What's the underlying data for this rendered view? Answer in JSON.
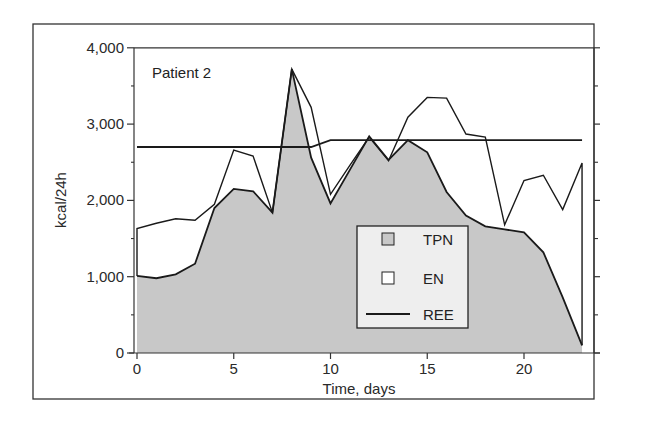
{
  "chart_data": {
    "type": "area",
    "title": "",
    "panel_label": "Patient 2",
    "xlabel": "Time, days",
    "ylabel": "kcal/24h",
    "xlim": [
      0,
      23
    ],
    "ylim": [
      0,
      4000
    ],
    "x_ticks": [
      0,
      5,
      10,
      15,
      20
    ],
    "x_tick_labels": [
      "0",
      "5",
      "10",
      "15",
      "20"
    ],
    "y_ticks": [
      0,
      1000,
      2000,
      3000,
      4000
    ],
    "y_tick_labels": [
      "0",
      "1,000",
      "2,000",
      "3,000",
      "4,000"
    ],
    "grid": false,
    "legend_position": "lower-right-inside",
    "x": [
      0,
      1,
      2,
      3,
      4,
      5,
      6,
      7,
      8,
      9,
      10,
      11,
      12,
      13,
      14,
      15,
      16,
      17,
      18,
      19,
      20,
      21,
      22,
      23
    ],
    "series": [
      {
        "name": "TPN",
        "style": "filled-area",
        "color": "#c8c8c8",
        "values": [
          1010,
          980,
          1030,
          1170,
          1900,
          2150,
          2120,
          1840,
          3720,
          2560,
          1960,
          2400,
          2840,
          2530,
          2790,
          2630,
          2110,
          1800,
          1660,
          1620,
          1580,
          1320,
          730,
          100
        ]
      },
      {
        "name": "EN",
        "style": "open-area-top-line",
        "color": "#ffffff",
        "values": [
          1630,
          1700,
          1760,
          1740,
          1950,
          2660,
          2580,
          1840,
          3720,
          3220,
          2080,
          2460,
          2830,
          2520,
          3090,
          3350,
          3340,
          2870,
          2830,
          1680,
          2260,
          2330,
          1880,
          2490
        ]
      },
      {
        "name": "REE",
        "style": "line",
        "color": "#1a1a1a",
        "values": [
          2700,
          2700,
          2700,
          2700,
          2700,
          2700,
          2700,
          2700,
          2700,
          2700,
          2790,
          2790,
          2790,
          2790,
          2790,
          2790,
          2790,
          2790,
          2790,
          2790,
          2790,
          2790,
          2790,
          2790
        ]
      }
    ]
  },
  "legend": {
    "items": [
      {
        "label": "TPN",
        "symbol": "gray-square"
      },
      {
        "label": "EN",
        "symbol": "white-square"
      },
      {
        "label": "REE",
        "symbol": "line"
      }
    ]
  },
  "colors": {
    "tpn_fill": "#c8c8c8",
    "line": "#1a1a1a",
    "frame": "#333333",
    "legend_bg": "#eeeeee"
  }
}
